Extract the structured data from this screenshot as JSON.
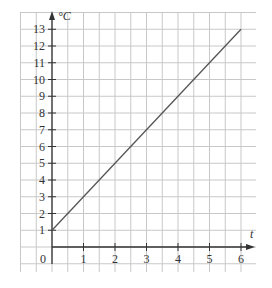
{
  "chart_data": {
    "type": "line",
    "title": "",
    "xlabel": "t",
    "ylabel": "°C",
    "x": [
      0,
      6
    ],
    "series": [
      {
        "name": "temperature",
        "values": [
          1,
          13
        ]
      }
    ],
    "x_ticks": [
      "1",
      "2",
      "3",
      "4",
      "5",
      "6"
    ],
    "y_ticks": [
      "1",
      "2",
      "3",
      "4",
      "5",
      "6",
      "7",
      "8",
      "9",
      "10",
      "11",
      "12",
      "13"
    ],
    "origin_label": "0",
    "xlim": [
      0,
      6
    ],
    "ylim": [
      0,
      13
    ],
    "grid": true,
    "legend": "none",
    "line_color": "#555555",
    "grid_color": "#c8c8c8"
  }
}
